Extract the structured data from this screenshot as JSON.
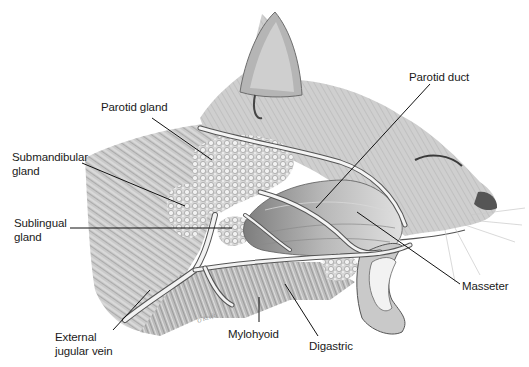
{
  "figure": {
    "colors": {
      "ink": "#1a1a1a",
      "leader": "#111111",
      "background": "#ffffff"
    }
  },
  "labels": [
    {
      "id": "parotid-gland",
      "lines": [
        "Parotid gland"
      ],
      "x": 101,
      "y": 100
    },
    {
      "id": "submandibular-gland",
      "lines": [
        "Submandibular",
        "gland"
      ],
      "x": 12,
      "y": 150
    },
    {
      "id": "sublingual-gland",
      "lines": [
        "Sublingual",
        "gland"
      ],
      "x": 14,
      "y": 216
    },
    {
      "id": "external-jugular-vein",
      "lines": [
        "External",
        "jugular vein"
      ],
      "x": 55,
      "y": 330
    },
    {
      "id": "mylohyoid",
      "lines": [
        "Mylohyoid"
      ],
      "x": 228,
      "y": 326
    },
    {
      "id": "digastric",
      "lines": [
        "Digastric"
      ],
      "x": 309,
      "y": 340
    },
    {
      "id": "masseter",
      "lines": [
        "Masseter"
      ],
      "x": 462,
      "y": 281
    },
    {
      "id": "parotid-duct",
      "lines": [
        "Parotid duct"
      ],
      "x": 409,
      "y": 70
    }
  ],
  "signature": "O'Keefe"
}
